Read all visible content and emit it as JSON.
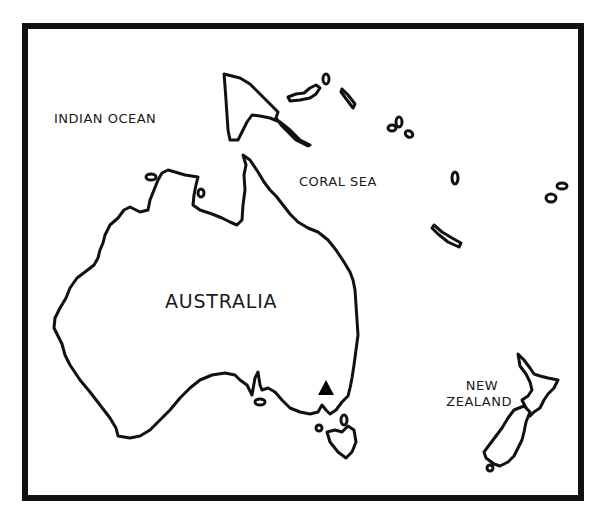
{
  "map": {
    "title": "Australia and Oceania outline map",
    "labels": {
      "indian_ocean": "INDIAN OCEAN",
      "coral_sea": "CORAL SEA",
      "australia": "AUSTRALIA",
      "new_zealand_line1": "NEW",
      "new_zealand_line2": "ZEALAND"
    },
    "markers": [
      {
        "name": "triangle-marker",
        "shape": "triangle",
        "color": "#000000",
        "location": "southeastern Australia"
      }
    ],
    "colors": {
      "outline": "#111111",
      "land_fill": "#ffffff",
      "background": "#ffffff",
      "frame": "#111111"
    }
  }
}
